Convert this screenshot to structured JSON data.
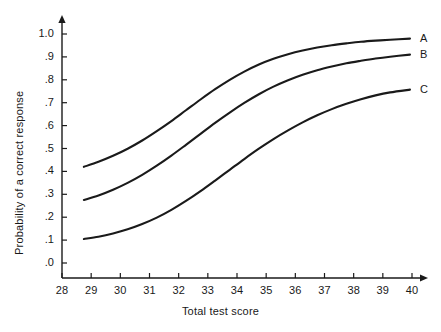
{
  "chart_data": {
    "type": "line",
    "title": "",
    "xlabel": "Total test score",
    "ylabel": "Probability of a correct response",
    "xlim": [
      28,
      40
    ],
    "ylim": [
      0.0,
      1.0
    ],
    "grid": false,
    "legend_position": "right-inline-end-labels",
    "xticks": [
      28,
      29,
      30,
      31,
      32,
      33,
      34,
      35,
      36,
      37,
      38,
      39,
      40
    ],
    "xtick_labels": [
      "28",
      "29",
      "30",
      "31",
      "32",
      "33",
      "34",
      "35",
      "36",
      "37",
      "38",
      "39",
      "40"
    ],
    "yticks": [
      0.0,
      0.1,
      0.2,
      0.3,
      0.4,
      0.5,
      0.6,
      0.7,
      0.8,
      0.9,
      1.0
    ],
    "ytick_labels": [
      ".0",
      ".1",
      ".2",
      ".3",
      ".4",
      ".5",
      ".6",
      ".7",
      ".8",
      ".9",
      "1.0"
    ],
    "axis_color": "#1a1a1a",
    "curve_color": "#1a1a1a",
    "x": [
      28.75,
      29.25,
      29.75,
      30.25,
      30.75,
      31.25,
      31.75,
      32.25,
      32.75,
      33.25,
      33.75,
      34.25,
      34.75,
      35.25,
      35.75,
      36.25,
      36.75,
      37.25,
      37.75,
      38.25,
      38.75,
      39.25,
      39.93
    ],
    "series": [
      {
        "name": "A",
        "label": "A",
        "values": [
          0.42,
          0.442,
          0.468,
          0.499,
          0.535,
          0.576,
          0.62,
          0.667,
          0.714,
          0.759,
          0.8,
          0.836,
          0.867,
          0.892,
          0.912,
          0.928,
          0.941,
          0.951,
          0.959,
          0.966,
          0.971,
          0.975,
          0.98
        ]
      },
      {
        "name": "B",
        "label": "B",
        "values": [
          0.275,
          0.295,
          0.32,
          0.35,
          0.385,
          0.425,
          0.469,
          0.516,
          0.564,
          0.612,
          0.657,
          0.699,
          0.737,
          0.77,
          0.798,
          0.822,
          0.842,
          0.858,
          0.872,
          0.883,
          0.893,
          0.901,
          0.91
        ]
      },
      {
        "name": "C",
        "label": "C",
        "values": [
          0.105,
          0.115,
          0.129,
          0.147,
          0.17,
          0.198,
          0.232,
          0.271,
          0.314,
          0.36,
          0.407,
          0.454,
          0.499,
          0.541,
          0.579,
          0.614,
          0.645,
          0.672,
          0.695,
          0.715,
          0.732,
          0.745,
          0.757
        ]
      }
    ]
  }
}
